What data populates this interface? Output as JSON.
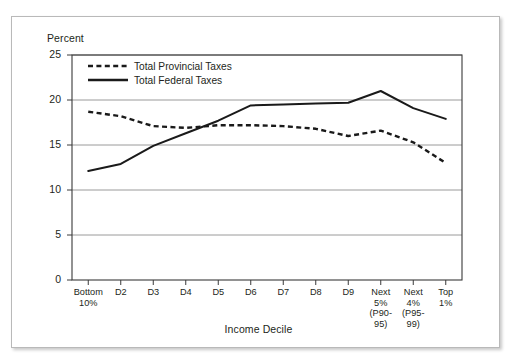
{
  "chart_data": {
    "type": "line",
    "title": "",
    "xlabel": "Income Decile",
    "ylabel": "Percent",
    "ylim": [
      0,
      25
    ],
    "yticks": [
      0,
      5,
      10,
      15,
      20,
      25
    ],
    "grid": true,
    "legend_position": "top-left",
    "categories": [
      "Bottom 10%",
      "D2",
      "D3",
      "D4",
      "D5",
      "D6",
      "D7",
      "D8",
      "D9",
      "Next 5% (P90-95)",
      "Next 4% (P95-99)",
      "Top 1%"
    ],
    "category_lines": [
      [
        "Bottom",
        "10%"
      ],
      [
        "D2"
      ],
      [
        "D3"
      ],
      [
        "D4"
      ],
      [
        "D5"
      ],
      [
        "D6"
      ],
      [
        "D7"
      ],
      [
        "D8"
      ],
      [
        "D9"
      ],
      [
        "Next",
        "5%",
        "(P90-",
        "95)"
      ],
      [
        "Next",
        "4%",
        "(P95-",
        "99)"
      ],
      [
        "Top",
        "1%"
      ]
    ],
    "series": [
      {
        "name": "Total Provincial Taxes",
        "style": "dashed",
        "color": "#1a1a1a",
        "values": [
          18.7,
          18.2,
          17.1,
          16.9,
          17.2,
          17.2,
          17.1,
          16.8,
          16.0,
          16.6,
          15.3,
          13.0
        ]
      },
      {
        "name": "Total Federal Taxes",
        "style": "solid",
        "color": "#1a1a1a",
        "values": [
          12.1,
          12.9,
          14.9,
          16.3,
          17.7,
          19.4,
          19.5,
          19.6,
          19.7,
          21.0,
          19.1,
          17.9
        ]
      }
    ]
  },
  "legend": {
    "items": [
      {
        "label": "Total Provincial Taxes"
      },
      {
        "label": "Total Federal Taxes"
      }
    ]
  }
}
